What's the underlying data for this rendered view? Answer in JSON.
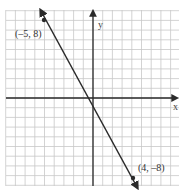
{
  "graph": {
    "x_axis_label": "x",
    "y_axis_label": "y",
    "points": [
      {
        "label": "(–5, 8)",
        "x": -5,
        "y": 8
      },
      {
        "label": "(4, –8)",
        "x": 4,
        "y": -8
      }
    ],
    "grid": {
      "xmin": -9,
      "xmax": 9,
      "ymin": -9,
      "ymax": 9,
      "step": 1
    },
    "line": {
      "passes_through": [
        [
          -5,
          8
        ],
        [
          4,
          -8
        ]
      ],
      "arrows_both_ends": true
    },
    "colors": {
      "grid": "#c8c8c8",
      "axis": "#2a2a2a",
      "line": "#2a2a2a"
    }
  }
}
